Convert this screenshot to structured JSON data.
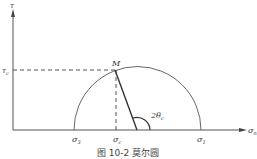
{
  "diagram": {
    "type": "mohr-circle",
    "caption": "图 10-2  莫尔圆",
    "axes": {
      "y_label": "τ",
      "x_label": "σ",
      "x_label_sub": "n"
    },
    "labels": {
      "point_m": "M",
      "tau_c": "τ",
      "tau_c_sub": "c",
      "sigma_3": "σ",
      "sigma_3_sub": "3",
      "sigma_c": "σ",
      "sigma_c_sub": "c",
      "sigma_1": "σ",
      "sigma_1_sub": "1",
      "angle": "2θ",
      "angle_sub": "c"
    },
    "colors": {
      "line": "#555555",
      "text": "#333333"
    }
  }
}
